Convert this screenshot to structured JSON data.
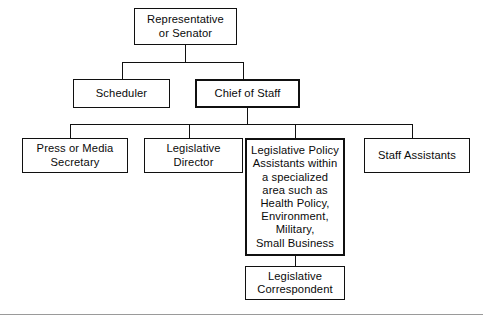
{
  "diagram": {
    "background_color": "#ffffff",
    "line_color": "#101010",
    "text_color": "#0a0a0a",
    "footer_rule_color": "#9a9a9a",
    "nodes": {
      "representative": {
        "label": "Representative\nor Senator",
        "level": 1,
        "emphasis": false
      },
      "scheduler": {
        "label": "Scheduler",
        "level": 2,
        "emphasis": false
      },
      "chief_of_staff": {
        "label": "Chief of Staff",
        "level": 2,
        "emphasis": true
      },
      "press_secretary": {
        "label": "Press or Media\nSecretary",
        "level": 3,
        "emphasis": false
      },
      "legislative_director": {
        "label": "Legislative\nDirector",
        "level": 3,
        "emphasis": false
      },
      "legislative_policy_assistants": {
        "label": "Legislative Policy\nAssistants within\na specialized\narea such as\nHealth Policy,\nEnvironment,\nMilitary,\nSmall Business",
        "level": 3,
        "emphasis": true
      },
      "staff_assistants": {
        "label": "Staff Assistants",
        "level": 3,
        "emphasis": false
      },
      "legislative_correspondent": {
        "label": "Legislative\nCorrespondent",
        "level": 4,
        "emphasis": false
      }
    },
    "edges": [
      {
        "from": "representative",
        "to": "scheduler"
      },
      {
        "from": "representative",
        "to": "chief_of_staff"
      },
      {
        "from": "chief_of_staff",
        "to": "press_secretary"
      },
      {
        "from": "chief_of_staff",
        "to": "legislative_director"
      },
      {
        "from": "chief_of_staff",
        "to": "legislative_policy_assistants"
      },
      {
        "from": "chief_of_staff",
        "to": "staff_assistants"
      },
      {
        "from": "legislative_policy_assistants",
        "to": "legislative_correspondent"
      }
    ]
  }
}
